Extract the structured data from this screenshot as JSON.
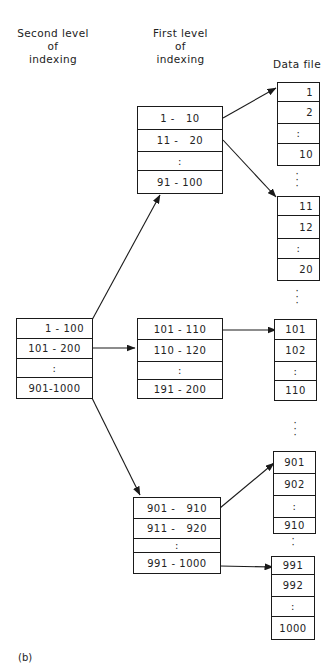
{
  "headers": {
    "second_level": [
      "Second level",
      "of",
      "indexing"
    ],
    "first_level": [
      "First level",
      "of",
      "indexing"
    ],
    "data_file": "Data file"
  },
  "second_level_index": {
    "rows": [
      "1 - 100",
      "101 - 200",
      ":",
      "901-1000"
    ]
  },
  "first_level_index": [
    {
      "rows": [
        "1 -   10",
        "11 -   20",
        ":",
        "91 - 100"
      ]
    },
    {
      "rows": [
        "101 - 110",
        "110 - 120",
        ":",
        "191 - 200"
      ]
    },
    {
      "rows": [
        "901 -   910",
        "911 -   920",
        ":",
        "991 - 1000"
      ]
    }
  ],
  "data_file_blocks": [
    {
      "rows": [
        "1",
        "2",
        ":",
        "10"
      ]
    },
    {
      "rows": [
        "11",
        "12",
        ":",
        "20"
      ]
    },
    {
      "rows": [
        "101",
        "102",
        ":",
        "110"
      ]
    },
    {
      "rows": [
        "901",
        "902",
        ":",
        "910"
      ]
    },
    {
      "rows": [
        "991",
        "992",
        ":",
        "1000"
      ]
    }
  ],
  "ellipsis": ":",
  "caption": "(b)",
  "colors": {
    "line": "#1a1a1a",
    "background": "#ffffff"
  }
}
